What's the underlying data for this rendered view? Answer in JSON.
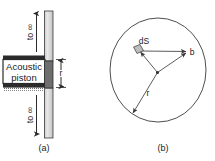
{
  "figure": {
    "panel_a": {
      "caption": "(a)",
      "piston_label_line1": "Acoustic",
      "piston_label_line2": "piston",
      "tube_top_label": "to ∞",
      "tube_bottom_label": "to ∞",
      "radius_label": "r",
      "colors": {
        "tube_fill": "#d9d9d9",
        "piston_fill": "#ffffff",
        "piston_edge": "#2b2b2b",
        "hatch": "#555555"
      }
    },
    "panel_b": {
      "caption": "(b)",
      "element_label": "dS",
      "point_label": "b",
      "radius_label": "r",
      "colors": {
        "circle_stroke": "#3a3a3a",
        "ray_stroke": "#4a4a4a",
        "patch_fill": "#bdbdbd"
      }
    }
  }
}
